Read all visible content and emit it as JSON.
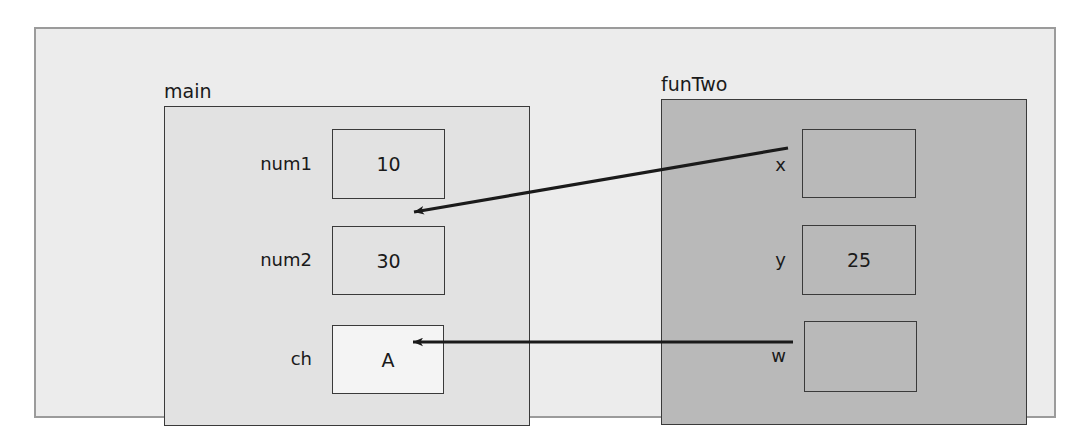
{
  "diagram": {
    "background_color": "#ececec",
    "outer_frame_border_color": "#9b9b9b"
  },
  "frames": [
    {
      "id": "main",
      "label": "main",
      "fill": "#e2e2e2",
      "variables": [
        {
          "id": "num1",
          "name": "num1",
          "value": "10",
          "empty": false
        },
        {
          "id": "num2",
          "name": "num2",
          "value": "30",
          "empty": false
        },
        {
          "id": "ch",
          "name": "ch",
          "value": "A",
          "empty": false
        }
      ]
    },
    {
      "id": "funTwo",
      "label": "funTwo",
      "fill": "#b9b9b9",
      "variables": [
        {
          "id": "x",
          "name": "x",
          "value": "",
          "empty": true
        },
        {
          "id": "y",
          "name": "y",
          "value": "25",
          "empty": false
        },
        {
          "id": "w",
          "name": "w",
          "value": "",
          "empty": true
        }
      ]
    }
  ],
  "arrows": [
    {
      "id": "x-to-num2",
      "from_variable": "x",
      "to_variable": "num2",
      "color": "#1a1a1a",
      "style": "solid-arrowhead-at-target",
      "from_point": [
        788,
        148
      ],
      "to_point": [
        412,
        212
      ]
    },
    {
      "id": "w-to-ch",
      "from_variable": "w",
      "to_variable": "ch",
      "color": "#1a1a1a",
      "style": "solid-arrowhead-at-target",
      "from_point": [
        793,
        342
      ],
      "to_point": [
        411,
        342
      ]
    }
  ]
}
